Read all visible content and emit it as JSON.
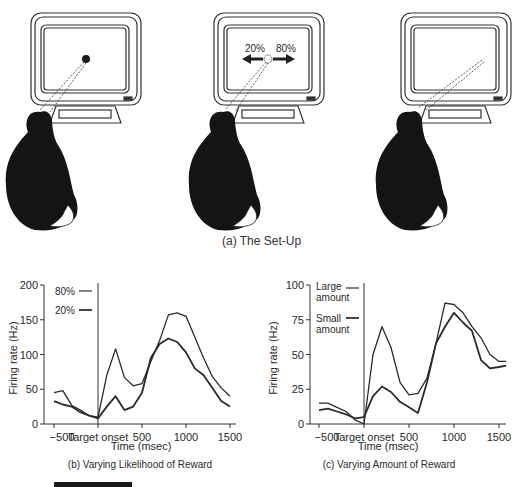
{
  "figure": {
    "setup": {
      "caption": "(a)  The Set-Up",
      "scenes": [
        {
          "label": "fixation",
          "target": "filled-dot"
        },
        {
          "label": "cue",
          "target": "open-circle",
          "left_pct": "20%",
          "right_pct": "80%"
        },
        {
          "label": "saccade",
          "target": "none"
        }
      ]
    },
    "panel_b": {
      "caption": "(b) Varying Likelihood of Reward",
      "xlabel": "Time (msec)",
      "ylabel": "Firing rate (Hz)",
      "onset_label": "Target onset",
      "legend": [
        "80%",
        "20%"
      ]
    },
    "panel_c": {
      "caption": "(c) Varying Amount of Reward",
      "xlabel": "Time (msec)",
      "ylabel": "Firing rate (Hz)",
      "onset_label": "Target onset",
      "legend": [
        "Large amount",
        "Small amount"
      ]
    }
  },
  "chart_data": [
    {
      "type": "line",
      "title": "(b) Varying Likelihood of Reward",
      "xlabel": "Time (msec)",
      "ylabel": "Firing rate (Hz)",
      "xticks": [
        -500,
        0,
        500,
        1000,
        1500
      ],
      "xtick_labels": [
        "−500",
        "Target onset",
        "500",
        "1000",
        "1500"
      ],
      "yticks": [
        0,
        50,
        100,
        150,
        200
      ],
      "xlim": [
        -550,
        1550
      ],
      "ylim": [
        0,
        200
      ],
      "grid": false,
      "legend_position": "upper-left",
      "annotations": [
        "vertical line at Target onset (0 ms)"
      ],
      "x": [
        -500,
        -400,
        -300,
        -200,
        -100,
        0,
        100,
        200,
        300,
        400,
        500,
        600,
        700,
        800,
        900,
        1000,
        1100,
        1200,
        1300,
        1400,
        1500
      ],
      "series": [
        {
          "name": "80%",
          "values": [
            45,
            48,
            27,
            20,
            12,
            10,
            70,
            108,
            67,
            55,
            58,
            90,
            120,
            157,
            160,
            155,
            125,
            95,
            68,
            52,
            40
          ]
        },
        {
          "name": "20%",
          "values": [
            33,
            28,
            25,
            17,
            12,
            8,
            25,
            40,
            20,
            25,
            45,
            95,
            115,
            123,
            118,
            103,
            80,
            70,
            52,
            33,
            25
          ]
        }
      ]
    },
    {
      "type": "line",
      "title": "(c) Varying Amount of Reward",
      "xlabel": "Time (msec)",
      "ylabel": "Firing rate (Hz)",
      "xticks": [
        -500,
        0,
        500,
        1000,
        1500
      ],
      "xtick_labels": [
        "−500",
        "Target onset",
        "500",
        "1000",
        "1500"
      ],
      "yticks": [
        0,
        25,
        50,
        75,
        100
      ],
      "xlim": [
        -550,
        1580
      ],
      "ylim": [
        0,
        100
      ],
      "grid": false,
      "legend_position": "upper-left",
      "annotations": [
        "vertical line at Target onset (0 ms)"
      ],
      "x": [
        -500,
        -400,
        -300,
        -200,
        -100,
        0,
        100,
        200,
        300,
        400,
        500,
        600,
        700,
        800,
        900,
        1000,
        1100,
        1200,
        1300,
        1400,
        1500,
        1580
      ],
      "series": [
        {
          "name": "Large amount",
          "values": [
            15,
            15,
            12,
            9,
            3,
            0,
            50,
            70,
            55,
            30,
            21,
            22,
            33,
            58,
            87,
            86,
            80,
            70,
            62,
            50,
            45,
            45
          ]
        },
        {
          "name": "Small amount",
          "values": [
            10,
            11,
            9,
            7,
            4,
            5,
            20,
            27,
            23,
            16,
            12,
            8,
            30,
            58,
            70,
            80,
            73,
            67,
            46,
            40,
            41,
            42
          ]
        }
      ]
    }
  ]
}
